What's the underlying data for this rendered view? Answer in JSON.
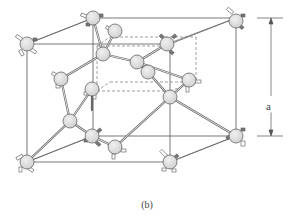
{
  "figure": {
    "caption": "(b)",
    "dimension_label": "a",
    "colors": {
      "atom_fill": "#d9d9d9",
      "atom_stroke": "#555555",
      "bond": "#666666",
      "frame": "#555555",
      "dashed": "#777777",
      "stub_dark": "#666666",
      "stub_light": "#ffffff"
    }
  }
}
